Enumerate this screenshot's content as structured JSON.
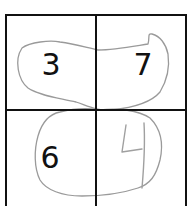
{
  "puzzle": {
    "grid": {
      "rows": 2,
      "cols": 2,
      "line_color": "#111111"
    },
    "cells": [
      {
        "row": 0,
        "col": 0,
        "value": "3",
        "style": "printed"
      },
      {
        "row": 0,
        "col": 1,
        "value": "7",
        "style": "printed"
      },
      {
        "row": 1,
        "col": 0,
        "value": "6",
        "style": "printed"
      },
      {
        "row": 1,
        "col": 1,
        "value": "4",
        "style": "handwritten"
      }
    ],
    "annotations": {
      "stroke_color": "#9a9a9a",
      "loops": [
        {
          "name": "top-row-loop",
          "encloses": [
            "3",
            "7"
          ]
        },
        {
          "name": "bottom-row-loop",
          "encloses": [
            "6",
            "4"
          ]
        }
      ]
    }
  }
}
